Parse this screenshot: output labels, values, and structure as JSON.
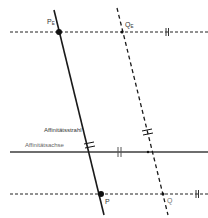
{
  "diagram": {
    "labels": {
      "pe": "P",
      "pe_sub": "E",
      "qe": "Q",
      "qe_sub": "E",
      "p": "P",
      "q": "Q",
      "ray": "Affinitätsstrahl",
      "axis": "Affinitätsachse"
    },
    "colors": {
      "line": "#1a1a1a",
      "axis": "#6e6e6e",
      "dash": "#222222",
      "text": "#333333"
    },
    "points": {
      "P_E": [
        59,
        32
      ],
      "Q_E": [
        122,
        32
      ],
      "P": [
        101,
        194
      ],
      "Q": [
        163,
        194
      ]
    }
  }
}
